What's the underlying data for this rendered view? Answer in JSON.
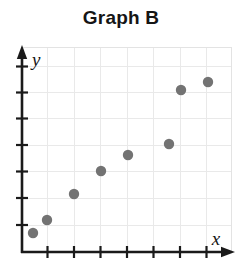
{
  "chart_data": {
    "type": "scatter",
    "title": "Graph B",
    "xlabel": "x",
    "ylabel": "y",
    "grid": true,
    "legend": "none",
    "xlim": [
      0,
      8
    ],
    "ylim": [
      0,
      8
    ],
    "x_tick_count": 7,
    "y_tick_count": 7,
    "x_tick_labels": [],
    "y_tick_labels": [],
    "series": [
      {
        "name": "Graph B data",
        "marker": "circle",
        "color": "#737373",
        "points": [
          {
            "x": 0.45,
            "y": 0.7
          },
          {
            "x": 1.0,
            "y": 1.2
          },
          {
            "x": 2.0,
            "y": 2.2
          },
          {
            "x": 3.0,
            "y": 3.1
          },
          {
            "x": 4.0,
            "y": 3.7
          },
          {
            "x": 5.55,
            "y": 4.15
          },
          {
            "x": 6.0,
            "y": 6.2
          },
          {
            "x": 7.0,
            "y": 6.5
          }
        ],
        "pixel_points": [
          {
            "cx": 33,
            "cy": 233
          },
          {
            "cx": 47,
            "cy": 220
          },
          {
            "cx": 74,
            "cy": 194
          },
          {
            "cx": 101,
            "cy": 171
          },
          {
            "cx": 128,
            "cy": 155
          },
          {
            "cx": 169,
            "cy": 144
          },
          {
            "cx": 181,
            "cy": 90
          },
          {
            "cx": 208,
            "cy": 82
          }
        ]
      }
    ],
    "colors": {
      "marker": "#737373",
      "axis": "#1a1a1a",
      "grid": "#e9e9e9",
      "title": "#151515",
      "background": "#ffffff"
    }
  },
  "figure": {
    "title": "Graph B",
    "x_axis_label": "x",
    "y_axis_label": "y"
  }
}
